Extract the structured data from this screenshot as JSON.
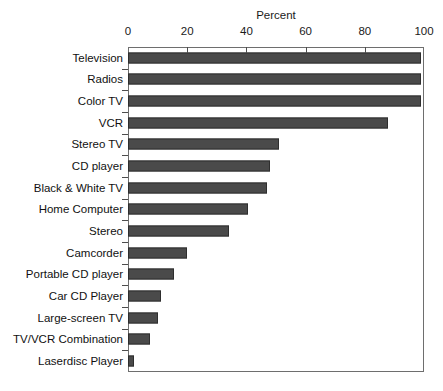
{
  "scan_artifact_text": "",
  "chart_data": {
    "type": "bar",
    "orientation": "horizontal",
    "title": "",
    "xlabel": "Percent",
    "ylabel": "",
    "xlim": [
      0,
      100
    ],
    "ylim": null,
    "grid": false,
    "legend": null,
    "axis_title_position": "top-center",
    "xticks": [
      0,
      20,
      40,
      60,
      80,
      100
    ],
    "xtick_labels": [
      "0",
      "20",
      "40",
      "60",
      "80",
      "100"
    ],
    "bar_color": "#4a4a4a",
    "bar_border_color": "#2e2e2e",
    "axis_color": "#6e6e6e",
    "categories": [
      "Television",
      "Radios",
      "Color TV",
      "VCR",
      "Stereo TV",
      "CD player",
      "Black & White TV",
      "Home Computer",
      "Stereo",
      "Camcorder",
      "Portable CD player",
      "Car CD Player",
      "Large-screen TV",
      "TV/VCR Combination",
      "Laserdisc Player"
    ],
    "values": [
      99,
      99,
      99,
      88,
      51,
      48,
      47,
      40.5,
      34,
      20,
      15.5,
      11,
      10,
      7.5,
      2
    ]
  }
}
